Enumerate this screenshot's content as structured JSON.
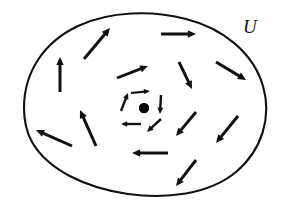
{
  "figure": {
    "width": 282,
    "height": 206,
    "background_color": "#ffffff",
    "ink_color": "#101010"
  },
  "region": {
    "label": "U",
    "label_position": {
      "x": 243,
      "y": 33
    },
    "outline_color": "#111111",
    "outline_width": 2.1,
    "path": "M 24 108 C 24 72 44 42 78 26 C 110 11 152 10 186 19 C 222 28 253 52 263 86 C 272 117 262 150 236 172 C 208 195 166 199 128 194 C 86 188 48 170 32 142 C 26 131 24 119 24 108 Z"
  },
  "singularity": {
    "name": "isolated-zero",
    "x": 144,
    "y": 108,
    "radius": 5.2,
    "color": "#0a0a0a"
  },
  "chart_data": {
    "type": "vector-field",
    "xlabel": "",
    "ylabel": "",
    "xlim": [
      0,
      282
    ],
    "ylim": [
      0,
      206
    ],
    "grid": false,
    "legend": null,
    "annotations": [
      {
        "text": "U",
        "x": 243,
        "y": 33
      }
    ],
    "singular_points": [
      {
        "x": 144,
        "y": 108,
        "type": "zero",
        "marker": "filled-dot"
      }
    ],
    "inner_vectors": [
      {
        "id": "inner-top",
        "x1": 131,
        "y1": 93,
        "x2": 150,
        "y2": 91,
        "angle_deg": -6,
        "length": 19,
        "head": 6.0,
        "width": 2.2
      },
      {
        "id": "inner-right",
        "x1": 161,
        "y1": 95,
        "x2": 160,
        "y2": 114,
        "angle_deg": 93,
        "length": 19,
        "head": 6.4,
        "width": 2.4
      },
      {
        "id": "inner-bottom-right",
        "x1": 161,
        "y1": 119,
        "x2": 147,
        "y2": 132,
        "angle_deg": 137,
        "length": 19,
        "head": 6.4,
        "width": 2.4
      },
      {
        "id": "inner-bottom-left",
        "x1": 141,
        "y1": 124,
        "x2": 121,
        "y2": 124,
        "angle_deg": 180,
        "length": 20,
        "head": 6.2,
        "width": 2.3
      },
      {
        "id": "inner-left",
        "x1": 121,
        "y1": 111,
        "x2": 128,
        "y2": 93,
        "angle_deg": -69,
        "length": 19,
        "head": 6.2,
        "width": 2.4
      }
    ],
    "outer_vectors": [
      {
        "id": "outer-upper-left-diagonal",
        "x1": 84,
        "y1": 59,
        "x2": 110,
        "y2": 28,
        "angle_deg": -50,
        "length": 40,
        "head": 8.2,
        "width": 3.0
      },
      {
        "id": "outer-left-up",
        "x1": 60,
        "y1": 92,
        "x2": 60,
        "y2": 57,
        "angle_deg": -90,
        "length": 35,
        "head": 8.0,
        "width": 3.0
      },
      {
        "id": "outer-top-right",
        "x1": 161,
        "y1": 34,
        "x2": 196,
        "y2": 34,
        "angle_deg": 0,
        "length": 35,
        "head": 8.2,
        "width": 3.0
      },
      {
        "id": "outer-mid-upper-right",
        "x1": 117,
        "y1": 78,
        "x2": 148,
        "y2": 66,
        "angle_deg": -21,
        "length": 33,
        "head": 8.0,
        "width": 2.9
      },
      {
        "id": "outer-right-down",
        "x1": 179,
        "y1": 62,
        "x2": 192,
        "y2": 89,
        "angle_deg": 64,
        "length": 30,
        "head": 8.0,
        "width": 2.9
      },
      {
        "id": "outer-far-right-down",
        "x1": 216,
        "y1": 62,
        "x2": 246,
        "y2": 80,
        "angle_deg": 31,
        "length": 35,
        "head": 8.2,
        "width": 3.0
      },
      {
        "id": "outer-lower-right-inner",
        "x1": 196,
        "y1": 112,
        "x2": 176,
        "y2": 136,
        "angle_deg": 130,
        "length": 31,
        "head": 8.0,
        "width": 2.9
      },
      {
        "id": "outer-lower-far-right",
        "x1": 238,
        "y1": 116,
        "x2": 216,
        "y2": 143,
        "angle_deg": 129,
        "length": 35,
        "head": 8.2,
        "width": 3.0
      },
      {
        "id": "outer-bottom-left-arrow",
        "x1": 168,
        "y1": 153,
        "x2": 132,
        "y2": 153,
        "angle_deg": 180,
        "length": 36,
        "head": 8.2,
        "width": 3.0
      },
      {
        "id": "outer-bottom-diagonal",
        "x1": 196,
        "y1": 160,
        "x2": 176,
        "y2": 186,
        "angle_deg": 128,
        "length": 33,
        "head": 8.0,
        "width": 2.9
      },
      {
        "id": "outer-left-arrow",
        "x1": 72,
        "y1": 146,
        "x2": 36,
        "y2": 130,
        "angle_deg": 204,
        "length": 39,
        "head": 8.2,
        "width": 3.0
      },
      {
        "id": "outer-lower-left-up",
        "x1": 96,
        "y1": 146,
        "x2": 80,
        "y2": 110,
        "angle_deg": -114,
        "length": 39,
        "head": 8.2,
        "width": 3.0
      }
    ]
  }
}
